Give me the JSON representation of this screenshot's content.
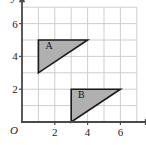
{
  "chart_data": {
    "type": "scatter",
    "title": "",
    "xlabel": "x",
    "ylabel": "y",
    "xlim": [
      0,
      7
    ],
    "ylim": [
      0,
      7
    ],
    "grid": true,
    "legend": "none",
    "origin_label": "O",
    "x_ticks": [
      {
        "value": 2,
        "label": "2"
      },
      {
        "value": 4,
        "label": "4"
      },
      {
        "value": 6,
        "label": "6"
      }
    ],
    "y_ticks": [
      {
        "value": 2,
        "label": "2"
      },
      {
        "value": 4,
        "label": "4"
      },
      {
        "value": 6,
        "label": "6"
      }
    ],
    "grid_x_lines": [
      0,
      1,
      2,
      3,
      4,
      5,
      6,
      7
    ],
    "grid_y_lines": [
      0,
      1,
      2,
      3,
      4,
      5,
      6,
      7
    ],
    "shapes": [
      {
        "name": "A",
        "type": "triangle",
        "vertices": [
          [
            1,
            5
          ],
          [
            4,
            5
          ],
          [
            1,
            3
          ]
        ],
        "label": "A",
        "label_position": [
          1.65,
          4.45
        ],
        "fill": "#b0b0b0",
        "stroke": "#1a1a1a"
      },
      {
        "name": "B",
        "type": "triangle",
        "vertices": [
          [
            3,
            2
          ],
          [
            6,
            2
          ],
          [
            3,
            0
          ]
        ],
        "label": "B",
        "label_position": [
          3.62,
          1.45
        ],
        "fill": "#b0b0b0",
        "stroke": "#1a1a1a"
      }
    ]
  },
  "colors": {
    "shape_fill": "#b0b0b0",
    "shape_stroke": "#1a1a1a",
    "grid_line": "#c8c8c8",
    "axis_line": "#4a4a4a",
    "text": "#1a1a1a",
    "background": "#ffffff"
  },
  "axes": {
    "x_axis_label": "x",
    "y_axis_label": "y",
    "origin": "O"
  }
}
